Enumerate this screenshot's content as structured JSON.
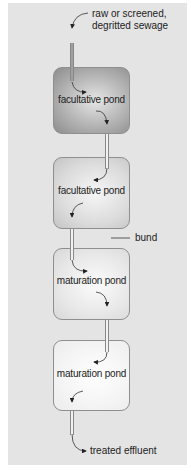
{
  "diagram": {
    "inlet_label_line1": "raw or screened,",
    "inlet_label_line2": "degritted sewage",
    "outlet_label": "treated effluent",
    "bund_label": "bund",
    "ponds": [
      {
        "label": "facultative pond",
        "fill_center": "#e6e6e6",
        "fill_edge": "#8c8c8c"
      },
      {
        "label": "facultative pond",
        "fill_center": "#f6f6f6",
        "fill_edge": "#c4c4c4"
      },
      {
        "label": "maturation pond",
        "fill_center": "#fbfbfb",
        "fill_edge": "#d8d8d8"
      },
      {
        "label": "maturation pond",
        "fill_center": "#ffffff",
        "fill_edge": "#ececec"
      }
    ],
    "flow": [
      "raw or screened, degritted sewage",
      "facultative pond",
      "facultative pond",
      "maturation pond",
      "maturation pond",
      "treated effluent"
    ],
    "colors": {
      "background_panel": "#e4e4e4",
      "outline": "#8f8f8f",
      "text": "#222222"
    }
  }
}
